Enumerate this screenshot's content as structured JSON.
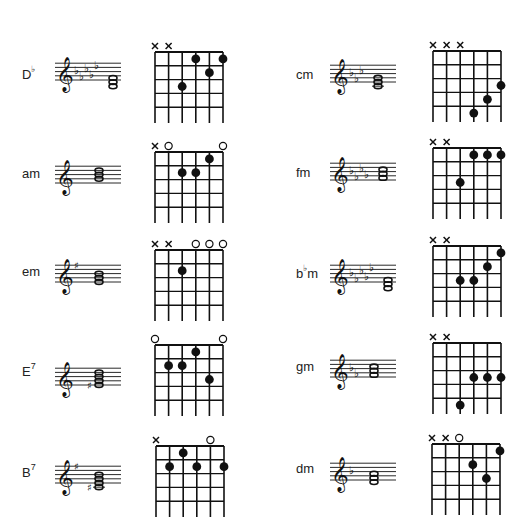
{
  "legend": {
    "muted": "×",
    "open": "○",
    "fingered": "●"
  },
  "strings_order": [
    "E6",
    "A5",
    "D4",
    "G3",
    "B2",
    "E1"
  ],
  "chords": [
    {
      "id": "Db",
      "root": "D",
      "accidental": "♭",
      "suffix": "",
      "column": 0,
      "row": 0,
      "key_signature": {
        "type": "flat",
        "count": 5
      },
      "notes_chord_accidental": "",
      "strings": [
        "x",
        "x",
        3,
        1,
        2,
        1
      ]
    },
    {
      "id": "am",
      "root": "am",
      "accidental": "",
      "suffix": "",
      "column": 0,
      "row": 1,
      "key_signature": {
        "type": "none",
        "count": 0
      },
      "notes_chord_accidental": "",
      "strings": [
        "x",
        "o",
        2,
        2,
        1,
        "o"
      ]
    },
    {
      "id": "em",
      "root": "em",
      "accidental": "",
      "suffix": "",
      "column": 0,
      "row": 2,
      "key_signature": {
        "type": "sharp",
        "count": 1
      },
      "notes_chord_accidental": "",
      "strings": [
        "x",
        "x",
        2,
        "o",
        "o",
        "o"
      ]
    },
    {
      "id": "E7",
      "root": "E",
      "accidental": "",
      "suffix": "7",
      "column": 0,
      "row": 3,
      "key_signature": {
        "type": "none",
        "count": 0
      },
      "notes_chord_accidental": "♯",
      "strings": [
        "o",
        2,
        2,
        1,
        3,
        "o"
      ]
    },
    {
      "id": "B7",
      "root": "B",
      "accidental": "",
      "suffix": "7",
      "column": 0,
      "row": 4,
      "key_signature": {
        "type": "sharp",
        "count": 1
      },
      "notes_chord_accidental": "♯",
      "strings": [
        "x",
        2,
        1,
        2,
        "o",
        2
      ]
    },
    {
      "id": "cm",
      "root": "cm",
      "accidental": "",
      "suffix": "",
      "column": 1,
      "row": 0,
      "key_signature": {
        "type": "flat",
        "count": 3
      },
      "notes_chord_accidental": "",
      "strings": [
        "x",
        "x",
        "x",
        5,
        4,
        3
      ]
    },
    {
      "id": "fm",
      "root": "fm",
      "accidental": "",
      "suffix": "",
      "column": 1,
      "row": 1,
      "key_signature": {
        "type": "flat",
        "count": 4
      },
      "notes_chord_accidental": "",
      "strings": [
        "x",
        "x",
        3,
        1,
        1,
        1
      ]
    },
    {
      "id": "bbm",
      "root": "b",
      "accidental": "♭",
      "suffix": "m",
      "column": 1,
      "row": 2,
      "key_signature": {
        "type": "flat",
        "count": 5
      },
      "notes_chord_accidental": "",
      "strings": [
        "x",
        "x",
        3,
        3,
        2,
        1
      ]
    },
    {
      "id": "gm",
      "root": "gm",
      "accidental": "",
      "suffix": "",
      "column": 1,
      "row": 3,
      "key_signature": {
        "type": "flat",
        "count": 2
      },
      "notes_chord_accidental": "",
      "strings": [
        "x",
        "x",
        5,
        3,
        3,
        3
      ]
    },
    {
      "id": "dm",
      "root": "dm",
      "accidental": "",
      "suffix": "",
      "column": 1,
      "row": 4,
      "key_signature": {
        "type": "flat",
        "count": 1
      },
      "notes_chord_accidental": "",
      "strings": [
        "x",
        "x",
        "o",
        2,
        3,
        1
      ]
    }
  ],
  "labels": {
    "Db": {
      "main": "D",
      "acc": "♭",
      "sup": ""
    },
    "am": {
      "main": "am",
      "acc": "",
      "sup": ""
    },
    "em": {
      "main": "em",
      "acc": "",
      "sup": ""
    },
    "E7": {
      "main": "E",
      "acc": "",
      "sup": "7"
    },
    "B7": {
      "main": "B",
      "acc": "",
      "sup": "7"
    },
    "cm": {
      "main": "cm",
      "acc": "",
      "sup": ""
    },
    "fm": {
      "main": "fm",
      "acc": "",
      "sup": ""
    },
    "bbm": {
      "main": "b",
      "acc": "♭",
      "sup": "m"
    },
    "gm": {
      "main": "gm",
      "acc": "",
      "sup": ""
    },
    "dm": {
      "main": "dm",
      "acc": "",
      "sup": ""
    }
  },
  "frets_shown": 5,
  "colors": {
    "ink": "#111111",
    "paper": "#ffffff"
  }
}
